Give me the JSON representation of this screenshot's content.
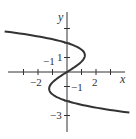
{
  "chart_data": {
    "type": "line",
    "title": "",
    "xlabel": "x",
    "ylabel": "y",
    "equation_hint": "x = 0.4·y·(4 − y²)",
    "x_ticks": [
      -4,
      -3,
      -2,
      -1,
      1,
      2,
      3
    ],
    "y_ticks": [
      -3,
      -2,
      -1,
      1,
      2,
      3
    ],
    "x_tick_labels": [
      {
        "value": -2,
        "text": "−2"
      },
      {
        "value": 2,
        "text": "2"
      },
      {
        "value": -1,
        "text": "−1"
      }
    ],
    "y_tick_labels": [
      {
        "value": 1,
        "text": "1"
      },
      {
        "value": -1,
        "text": "−1"
      },
      {
        "value": -3,
        "text": "−3"
      }
    ],
    "series": [
      {
        "name": "curve",
        "points": [
          [
            -4.3,
            2.8
          ],
          [
            -2.5,
            2.5
          ],
          [
            0,
            2
          ],
          [
            1.2,
            1
          ],
          [
            0,
            0
          ],
          [
            -1.2,
            -1
          ],
          [
            0,
            -2
          ],
          [
            2.5,
            -2.5
          ],
          [
            4.3,
            -2.8
          ]
        ]
      }
    ],
    "xlim": [
      -4.5,
      4.5
    ],
    "ylim": [
      -3.5,
      3
    ],
    "grid": false,
    "legend": false
  },
  "labels": {
    "x_axis": "x",
    "y_axis": "y",
    "tick_neg2": "−2",
    "tick_2": "2",
    "tick_x_neg1": "−1",
    "tick_y1": "1",
    "tick_y_neg1": "−1",
    "tick_y_neg3": "−3"
  }
}
